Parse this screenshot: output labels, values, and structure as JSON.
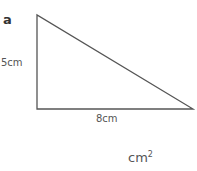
{
  "question": {
    "label": "a",
    "shape": "right-triangle",
    "height_label": "5cm",
    "base_label": "8cm",
    "answer_unit": "cm",
    "answer_unit_power": "2"
  },
  "colors": {
    "stroke": "#555555",
    "text": "#555555"
  }
}
